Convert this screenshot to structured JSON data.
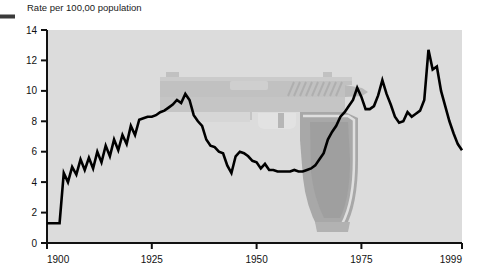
{
  "figure": {
    "title": "Rate per 100,00 population",
    "left_marker": "dash-rule",
    "background_color": "#ffffff",
    "plot_background_color": "#dddddd",
    "line_color": "#000000",
    "watermark": "handgun-silhouette",
    "watermark_colors": [
      "#c4c4c4",
      "#a8a8a8",
      "#9a9a9a",
      "#e6e6e6"
    ]
  },
  "chart_data": {
    "type": "line",
    "title": "Rate per 100,00 population",
    "xlabel": "",
    "ylabel": "Rate per 100,00 population",
    "xlim": [
      1900,
      1999
    ],
    "ylim": [
      0,
      14
    ],
    "ytick_labels": [
      "0",
      "2",
      "4",
      "6",
      "8",
      "10",
      "12",
      "14"
    ],
    "yticks": [
      0,
      2,
      4,
      6,
      8,
      10,
      12,
      14
    ],
    "xtick_labels": [
      "1900",
      "1925",
      "1950",
      "1975",
      "1999"
    ],
    "xticks": [
      1900,
      1925,
      1950,
      1975,
      1999
    ],
    "grid": false,
    "legend": "none",
    "series": [
      {
        "name": "Homicide rate",
        "x": [
          1900,
          1901,
          1902,
          1903,
          1904,
          1905,
          1906,
          1907,
          1908,
          1909,
          1910,
          1911,
          1912,
          1913,
          1914,
          1915,
          1916,
          1917,
          1918,
          1919,
          1920,
          1921,
          1922,
          1923,
          1924,
          1925,
          1926,
          1927,
          1928,
          1929,
          1930,
          1931,
          1932,
          1933,
          1934,
          1935,
          1936,
          1937,
          1938,
          1939,
          1940,
          1941,
          1942,
          1943,
          1944,
          1945,
          1946,
          1947,
          1948,
          1949,
          1950,
          1951,
          1952,
          1953,
          1954,
          1955,
          1956,
          1957,
          1958,
          1959,
          1960,
          1961,
          1962,
          1963,
          1964,
          1965,
          1966,
          1967,
          1968,
          1969,
          1970,
          1971,
          1972,
          1973,
          1974,
          1975,
          1976,
          1977,
          1978,
          1979,
          1980,
          1981,
          1982,
          1983,
          1984,
          1985,
          1986,
          1987,
          1988,
          1989,
          1990,
          1991,
          1992,
          1993,
          1994,
          1995,
          1996,
          1997,
          1998,
          1999
        ],
        "values": [
          1.3,
          1.3,
          1.3,
          1.3,
          4.6,
          4.0,
          5.0,
          4.5,
          5.5,
          4.8,
          5.6,
          4.9,
          6.0,
          5.3,
          6.4,
          5.7,
          6.8,
          6.1,
          7.1,
          6.5,
          7.7,
          7.1,
          8.1,
          8.2,
          8.3,
          8.3,
          8.4,
          8.6,
          8.7,
          8.9,
          9.1,
          9.4,
          9.2,
          9.8,
          9.4,
          8.4,
          8.0,
          7.7,
          6.8,
          6.4,
          6.3,
          6.0,
          5.9,
          5.1,
          4.6,
          5.7,
          6.0,
          5.9,
          5.7,
          5.4,
          5.3,
          4.9,
          5.2,
          4.8,
          4.8,
          4.7,
          4.7,
          4.7,
          4.7,
          4.8,
          4.7,
          4.7,
          4.8,
          4.9,
          5.1,
          5.5,
          5.9,
          6.8,
          7.3,
          7.7,
          8.3,
          8.6,
          9.0,
          9.4,
          10.2,
          9.6,
          8.8,
          8.8,
          9.0,
          9.7,
          10.7,
          9.8,
          9.1,
          8.3,
          7.9,
          8.0,
          8.6,
          8.3,
          8.5,
          8.7,
          9.4,
          12.7,
          11.4,
          11.6,
          10.0,
          9.0,
          8.0,
          7.2,
          6.5,
          6.1
        ]
      }
    ]
  }
}
